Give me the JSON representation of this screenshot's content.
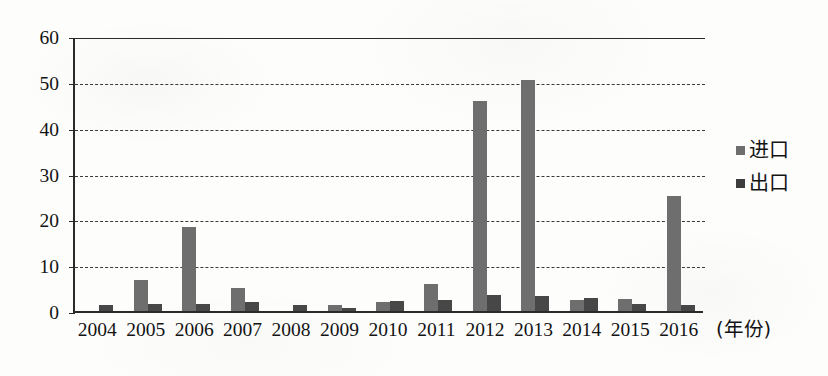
{
  "chart_data": {
    "type": "bar",
    "title": "",
    "xlabel": "(年份)",
    "ylabel": "",
    "ylim": [
      0,
      60
    ],
    "ytick_step": 10,
    "yticks": [
      "0",
      "10",
      "20",
      "30",
      "40",
      "50",
      "60"
    ],
    "grid": true,
    "legend_position": "right",
    "categories": [
      "2004",
      "2005",
      "2006",
      "2007",
      "2008",
      "2009",
      "2010",
      "2011",
      "2012",
      "2013",
      "2014",
      "2015",
      "2016"
    ],
    "series": [
      {
        "name": "进口",
        "color": "#6e6e6e",
        "values": [
          0,
          6.8,
          18.3,
          5.0,
          0,
          1.3,
          1.9,
          6.0,
          45.8,
          50.5,
          2.3,
          2.7,
          25.0
        ]
      },
      {
        "name": "出口",
        "color": "#474747",
        "values": [
          1.3,
          1.6,
          1.6,
          2.0,
          1.3,
          0.7,
          2.1,
          2.4,
          3.4,
          3.3,
          2.9,
          1.6,
          1.4
        ]
      }
    ]
  },
  "legend": {
    "items": [
      {
        "label": "进口",
        "swatch_name": "legend-swatch-import"
      },
      {
        "label": "出口",
        "swatch_name": "legend-swatch-export"
      }
    ]
  },
  "axis": {
    "x_unit_label": "(年份)"
  }
}
